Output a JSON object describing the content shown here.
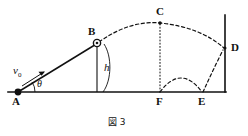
{
  "figure": {
    "caption": "図 3",
    "labels": {
      "point_a": "A",
      "point_b": "B",
      "point_c": "C",
      "point_d": "D",
      "point_e": "E",
      "point_f": "F",
      "height": "h",
      "angle": "θ",
      "velocity": "v",
      "velocity_sub": "0"
    },
    "colors": {
      "ink": "#111111",
      "background": "#ffffff"
    }
  },
  "geometry": {
    "ground_y": 92,
    "ground_x_start": 8,
    "ground_x_end": 226,
    "wall_x": 225,
    "wall_y_top": 15,
    "point_a": {
      "x": 18,
      "y": 92
    },
    "point_b": {
      "x": 97,
      "y": 43
    },
    "point_c": {
      "x": 160,
      "y": 23
    },
    "point_d": {
      "x": 225,
      "y": 48
    },
    "point_e": {
      "x": 202,
      "y": 92
    },
    "point_f": {
      "x": 160,
      "y": 92
    }
  }
}
